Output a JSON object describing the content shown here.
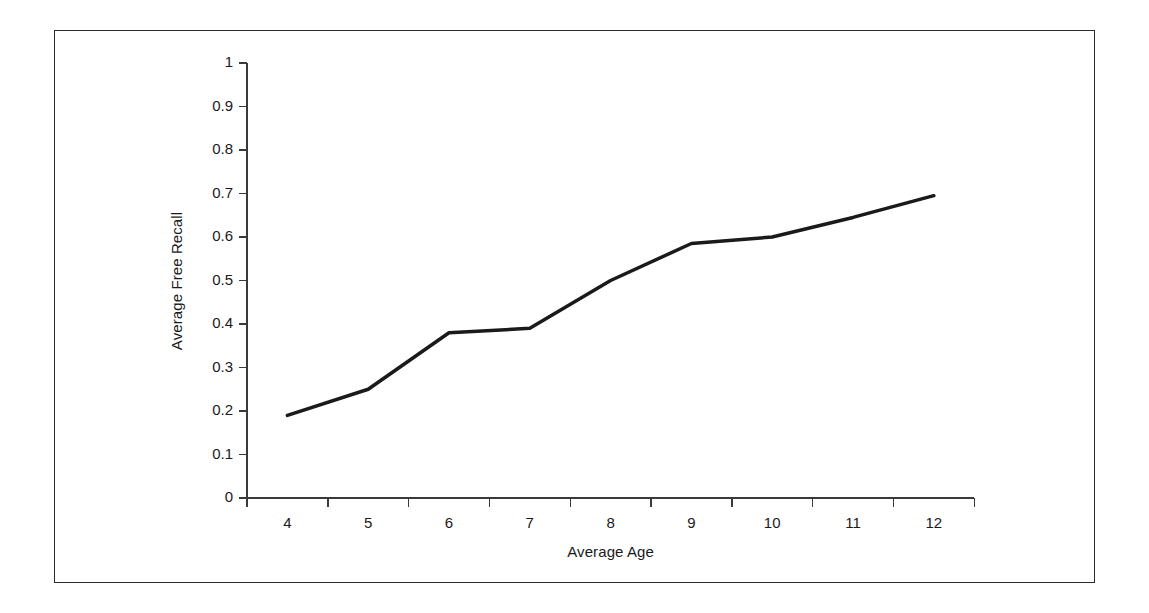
{
  "chart_data": {
    "type": "line",
    "title": "",
    "xlabel": "Average Age",
    "ylabel": "Average Free Recall",
    "categories": [
      "4",
      "5",
      "6",
      "7",
      "8",
      "9",
      "10",
      "11",
      "12"
    ],
    "x": [
      4,
      5,
      6,
      7,
      8,
      9,
      10,
      11,
      12
    ],
    "values": [
      0.19,
      0.25,
      0.38,
      0.39,
      0.5,
      0.585,
      0.6,
      0.645,
      0.695
    ],
    "series": [
      {
        "name": "Average Free Recall",
        "values": [
          0.19,
          0.25,
          0.38,
          0.39,
          0.5,
          0.585,
          0.6,
          0.645,
          0.695
        ]
      }
    ],
    "ylim": [
      0,
      1
    ],
    "y_ticks": [
      0,
      0.1,
      0.2,
      0.3,
      0.4,
      0.5,
      0.6,
      0.7,
      0.8,
      0.9,
      1
    ],
    "y_tick_labels": [
      "0",
      "0.1",
      "0.2",
      "0.3",
      "0.4",
      "0.5",
      "0.6",
      "0.7",
      "0.8",
      "0.9",
      "1"
    ],
    "x_tick_labels": [
      "4",
      "5",
      "6",
      "7",
      "8",
      "9",
      "10",
      "11",
      "12"
    ],
    "grid": false,
    "legend": null,
    "legend_position": "none",
    "line_color": "#1a1a1a",
    "line_width": 3.5,
    "markers": false,
    "axis_color": "#3a3a3a",
    "frame_color": "#2b2b2b",
    "background_color": "#ffffff"
  }
}
